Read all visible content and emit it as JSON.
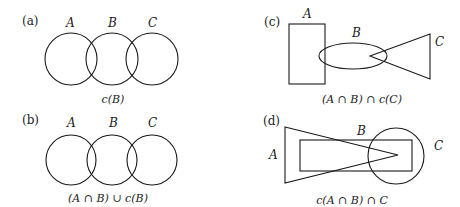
{
  "panels": [
    {
      "id": "a",
      "label": "(a)",
      "set_labels": [
        "A",
        "B",
        "C"
      ],
      "shapes": [
        "circle",
        "circle",
        "circle"
      ],
      "caption": "c(B)"
    },
    {
      "id": "b",
      "label": "(b)",
      "set_labels": [
        "A",
        "B",
        "C"
      ],
      "shapes": [
        "circle",
        "circle",
        "circle"
      ],
      "caption": "(A ∩ B) ∪ c(B)"
    },
    {
      "id": "c",
      "label": "(c)",
      "set_labels": [
        "A",
        "B",
        "C"
      ],
      "shapes": [
        "rectangle",
        "ellipse",
        "triangle"
      ],
      "caption": "(A ∩ B) ∩ c(C)"
    },
    {
      "id": "d",
      "label": "(d)",
      "set_labels": [
        "A",
        "B",
        "C"
      ],
      "shapes": [
        "triangle",
        "rectangle",
        "circle"
      ],
      "caption": "c(A ∩ B) ∩ C"
    }
  ],
  "colors": {
    "stroke": "#1a1a1a",
    "background": "#ffffff"
  }
}
